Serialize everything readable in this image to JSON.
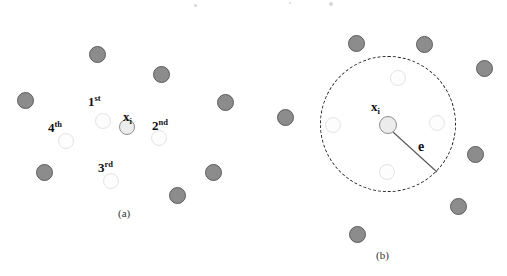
{
  "figure": {
    "title": "",
    "panels": [
      {
        "id": "a",
        "caption": "(a)",
        "caption_x": 118,
        "caption_y": 208,
        "center_node": {
          "name": "x_i",
          "label_main": "x",
          "label_sub": "i",
          "x": 127,
          "y": 127,
          "r": 8,
          "label_x": 123,
          "label_y": 110
        },
        "neighbor_nodes": [
          {
            "rank": "1st",
            "label_main": "1",
            "label_sup": "st",
            "x": 103,
            "y": 121,
            "r": 8,
            "label_x": 88,
            "label_y": 95
          },
          {
            "rank": "2nd",
            "label_main": "2",
            "label_sup": "nd",
            "x": 159,
            "y": 138,
            "r": 8,
            "label_x": 152,
            "label_y": 119
          },
          {
            "rank": "3rd",
            "label_main": "3",
            "label_sup": "rd",
            "x": 111,
            "y": 181,
            "r": 8,
            "label_x": 98,
            "label_y": 161
          },
          {
            "rank": "4th",
            "label_main": "4",
            "label_sup": "th",
            "x": 66,
            "y": 141,
            "r": 8,
            "label_x": 48,
            "label_y": 121
          }
        ],
        "outer_nodes": [
          {
            "x": 97,
            "y": 54,
            "r": 8.5
          },
          {
            "x": 161,
            "y": 74,
            "r": 8.5
          },
          {
            "x": 25,
            "y": 100,
            "r": 8.5
          },
          {
            "x": 225,
            "y": 102,
            "r": 8.5
          },
          {
            "x": 44,
            "y": 172,
            "r": 8.5
          },
          {
            "x": 213,
            "y": 172,
            "r": 8.5
          },
          {
            "x": 177,
            "y": 195,
            "r": 8.5
          }
        ]
      },
      {
        "id": "b",
        "caption": "(b)",
        "caption_x": 376,
        "caption_y": 250,
        "center_node": {
          "name": "x_i",
          "label_main": "x",
          "label_sub": "i",
          "x": 388,
          "y": 125,
          "r": 9,
          "label_x": 371,
          "label_y": 106
        },
        "epsilon_circle": {
          "cx": 388,
          "cy": 124,
          "r": 68,
          "stroke": "#1f1f1f",
          "dashed": true
        },
        "radius_line": {
          "label": "e",
          "x1": 392,
          "y1": 131,
          "x2": 437,
          "y2": 172,
          "label_x": 418,
          "label_y": 142,
          "stroke": "#55555a"
        },
        "neighbor_nodes": [
          {
            "x": 398,
            "y": 78,
            "r": 8
          },
          {
            "x": 437,
            "y": 123,
            "r": 8
          },
          {
            "x": 387,
            "y": 172,
            "r": 8
          },
          {
            "x": 333,
            "y": 125,
            "r": 8
          }
        ],
        "outer_nodes": [
          {
            "x": 356,
            "y": 43,
            "r": 8.5
          },
          {
            "x": 424,
            "y": 44,
            "r": 8.5
          },
          {
            "x": 484,
            "y": 68,
            "r": 8.5
          },
          {
            "x": 285,
            "y": 117,
            "r": 8.5
          },
          {
            "x": 475,
            "y": 154,
            "r": 8.5
          },
          {
            "x": 458,
            "y": 206,
            "r": 8.5
          },
          {
            "x": 357,
            "y": 234,
            "r": 8.5
          }
        ]
      }
    ],
    "colors": {
      "outer_fill": "#8c8c8c",
      "outer_stroke": "#5c5c5c",
      "neighbor_fill": "#fdfdfd",
      "neighbor_stroke": "#e4e4e4",
      "center_fill": "#ececec",
      "center_stroke": "#8f8f8f",
      "epsilon_stroke": "#1f1f1f",
      "text": "#111111",
      "background": "#ffffff"
    },
    "specks": [
      {
        "x": 195,
        "y": 5,
        "r": 1.2
      },
      {
        "x": 331,
        "y": 4,
        "r": 1.6
      },
      {
        "x": 290,
        "y": 3,
        "r": 1.0
      }
    ]
  }
}
